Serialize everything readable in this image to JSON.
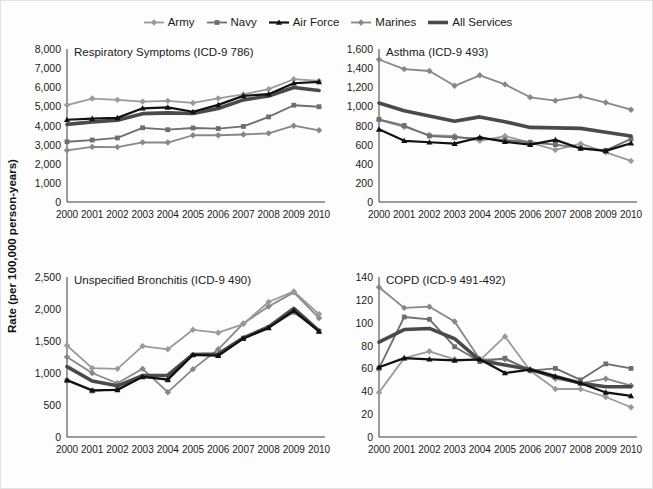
{
  "figure": {
    "ylabel": "Rate (per 100,000 person-years)",
    "legend": [
      {
        "name": "Army",
        "color": "#9a9a9a",
        "marker": "diamond",
        "width": 1.8
      },
      {
        "name": "Navy",
        "color": "#6e6e6e",
        "marker": "square",
        "width": 1.8
      },
      {
        "name": "Air Force",
        "color": "#111111",
        "marker": "triangle",
        "width": 2.2
      },
      {
        "name": "Marines",
        "color": "#878787",
        "marker": "diamond",
        "width": 1.8
      },
      {
        "name": "All Services",
        "color": "#4a4a4a",
        "marker": "none",
        "width": 3.6
      }
    ]
  },
  "chart_data": [
    {
      "type": "line",
      "title": "Respiratory Symptoms (ICD-9 786)",
      "xlabel": "",
      "ylabel": "Rate (per 100,000 person-years)",
      "x": [
        2000,
        2001,
        2002,
        2003,
        2004,
        2005,
        2006,
        2007,
        2008,
        2009,
        2010
      ],
      "xticks": [
        "2000",
        "2001",
        "2002",
        "2003",
        "2004",
        "2005",
        "2006",
        "2007",
        "2008",
        "2009",
        "2010"
      ],
      "yticks": [
        "0",
        "1,000",
        "2,000",
        "3,000",
        "4,000",
        "5,000",
        "6,000",
        "7,000",
        "8,000"
      ],
      "ylim": [
        0,
        8000
      ],
      "ytick_values": [
        0,
        1000,
        2000,
        3000,
        4000,
        5000,
        6000,
        7000,
        8000
      ],
      "grid": false,
      "legend_position": "figure-top",
      "series": [
        {
          "name": "Army",
          "values": [
            5070,
            5410,
            5340,
            5250,
            5290,
            5180,
            5420,
            5630,
            5900,
            6420,
            6330
          ]
        },
        {
          "name": "Navy",
          "values": [
            3150,
            3240,
            3350,
            3880,
            3780,
            3870,
            3840,
            3950,
            4450,
            5060,
            4980
          ]
        },
        {
          "name": "Air Force",
          "values": [
            4300,
            4360,
            4400,
            4900,
            4950,
            4720,
            5080,
            5550,
            5640,
            6210,
            6280
          ]
        },
        {
          "name": "Marines",
          "values": [
            2700,
            2880,
            2870,
            3120,
            3110,
            3490,
            3490,
            3530,
            3590,
            3990,
            3750
          ]
        },
        {
          "name": "All Services",
          "values": [
            4060,
            4180,
            4280,
            4620,
            4660,
            4630,
            4890,
            5340,
            5540,
            5990,
            5830
          ]
        }
      ]
    },
    {
      "type": "line",
      "title": "Asthma (ICD-9 493)",
      "xlabel": "",
      "ylabel": "Rate (per 100,000 person-years)",
      "x": [
        2000,
        2001,
        2002,
        2003,
        2004,
        2005,
        2006,
        2007,
        2008,
        2009,
        2010
      ],
      "xticks": [
        "2000",
        "2001",
        "2002",
        "2003",
        "2004",
        "2005",
        "2006",
        "2007",
        "2008",
        "2009",
        "2010"
      ],
      "yticks": [
        "0",
        "200",
        "400",
        "600",
        "800",
        "1,000",
        "1,200",
        "1,400",
        "1,600"
      ],
      "ylim": [
        0,
        1600
      ],
      "ytick_values": [
        0,
        200,
        400,
        600,
        800,
        1000,
        1200,
        1400,
        1600
      ],
      "grid": false,
      "legend_position": "figure-top",
      "series": [
        {
          "name": "Army",
          "values": [
            855,
            785,
            700,
            690,
            640,
            690,
            620,
            545,
            610,
            520,
            430
          ]
        },
        {
          "name": "Navy",
          "values": [
            865,
            800,
            690,
            675,
            665,
            650,
            625,
            600,
            565,
            540,
            660
          ]
        },
        {
          "name": "Air Force",
          "values": [
            760,
            640,
            625,
            610,
            675,
            630,
            600,
            650,
            560,
            535,
            615
          ]
        },
        {
          "name": "Marines",
          "values": [
            1490,
            1390,
            1370,
            1215,
            1325,
            1230,
            1095,
            1060,
            1105,
            1040,
            965
          ]
        },
        {
          "name": "All Services",
          "values": [
            1035,
            955,
            900,
            845,
            890,
            840,
            780,
            775,
            770,
            730,
            690
          ]
        }
      ]
    },
    {
      "type": "line",
      "title": "Unspecified Bronchitis (ICD-9 490)",
      "xlabel": "",
      "ylabel": "Rate (per 100,000 person-years)",
      "x": [
        2000,
        2001,
        2002,
        2003,
        2004,
        2005,
        2006,
        2007,
        2008,
        2009,
        2010
      ],
      "xticks": [
        "2000",
        "2001",
        "2002",
        "2003",
        "2004",
        "2005",
        "2006",
        "2007",
        "2008",
        "2009",
        "2010"
      ],
      "yticks": [
        "0",
        "500",
        "1,000",
        "1,500",
        "2,000",
        "2,500"
      ],
      "ylim": [
        0,
        2500
      ],
      "ytick_values": [
        0,
        500,
        1000,
        1500,
        2000,
        2500
      ],
      "grid": false,
      "legend_position": "figure-top",
      "series": [
        {
          "name": "Army",
          "values": [
            1430,
            1075,
            1065,
            1420,
            1370,
            1675,
            1630,
            1765,
            2110,
            2275,
            1920
          ]
        },
        {
          "name": "Navy",
          "values": [
            880,
            720,
            745,
            945,
            890,
            1280,
            1275,
            1545,
            1710,
            1950,
            1655
          ]
        },
        {
          "name": "Air Force",
          "values": [
            890,
            730,
            735,
            940,
            900,
            1285,
            1270,
            1540,
            1705,
            1975,
            1650
          ]
        },
        {
          "name": "Marines",
          "values": [
            1250,
            1000,
            840,
            1065,
            700,
            1060,
            1370,
            1775,
            2040,
            2260,
            1860
          ]
        },
        {
          "name": "All Services",
          "values": [
            1100,
            875,
            800,
            960,
            965,
            1290,
            1295,
            1550,
            1720,
            2010,
            1660
          ]
        }
      ]
    },
    {
      "type": "line",
      "title": "COPD (ICD-9 491-492)",
      "xlabel": "",
      "ylabel": "Rate (per 100,000 person-years)",
      "x": [
        2000,
        2001,
        2002,
        2003,
        2004,
        2005,
        2006,
        2007,
        2008,
        2009,
        2010
      ],
      "xticks": [
        "2000",
        "2001",
        "2002",
        "2003",
        "2004",
        "2005",
        "2006",
        "2007",
        "2008",
        "2009",
        "2010"
      ],
      "yticks": [
        "0",
        "20",
        "40",
        "60",
        "80",
        "100",
        "120",
        "140"
      ],
      "ylim": [
        0,
        140
      ],
      "ytick_values": [
        0,
        20,
        40,
        60,
        80,
        100,
        120,
        140
      ],
      "grid": false,
      "legend_position": "figure-top",
      "series": [
        {
          "name": "Army",
          "values": [
            39,
            69,
            75,
            68,
            67,
            88,
            58,
            42,
            42,
            35,
            26
          ]
        },
        {
          "name": "Navy",
          "values": [
            60,
            105,
            103,
            79,
            66,
            69,
            58,
            60,
            50,
            64,
            60
          ]
        },
        {
          "name": "Air Force",
          "values": [
            61,
            69,
            68,
            67,
            68,
            56,
            59,
            53,
            47,
            39,
            36
          ]
        },
        {
          "name": "Marines",
          "values": [
            131,
            113,
            114,
            101,
            68,
            68,
            59,
            51,
            47,
            51,
            45
          ]
        },
        {
          "name": "All Services",
          "values": [
            83,
            94,
            95,
            86,
            67,
            63,
            59,
            53,
            47,
            44,
            44
          ]
        }
      ]
    }
  ]
}
